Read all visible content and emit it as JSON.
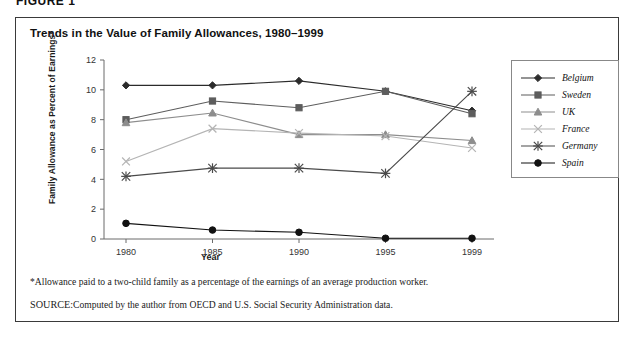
{
  "figure_label": "FIGURE 1",
  "panel": {
    "title": "Trends in the Value of Family Allowances, 1980–1999"
  },
  "footnotes": {
    "allowance_note": "*Allowance paid to a two-child family as a percentage of the earnings of an average production worker.",
    "source_prefix": "SOURCE:",
    "source_text": "Computed by the author from OECD and U.S. Social Security Administration data."
  },
  "legend": {
    "position": "right",
    "entries": [
      {
        "label": "Belgium",
        "marker": "diamond",
        "color": "#2b2b2b"
      },
      {
        "label": "Sweden",
        "marker": "square",
        "color": "#5d5d5d"
      },
      {
        "label": "UK",
        "marker": "triangle",
        "color": "#8d8d8d"
      },
      {
        "label": "France",
        "marker": "x",
        "color": "#b4b4b4"
      },
      {
        "label": "Germany",
        "marker": "asterisk",
        "color": "#4a4a4a"
      },
      {
        "label": "Spain",
        "marker": "circle",
        "color": "#111111"
      }
    ]
  },
  "chart_data": {
    "type": "line",
    "title": "Trends in the Value of Family Allowances, 1980–1999",
    "xlabel": "Year",
    "ylabel": "Family Allowance as Percent of Earnings*",
    "categories": [
      "1980",
      "1985",
      "1990",
      "1995",
      "1999"
    ],
    "x": [
      1980,
      1985,
      1990,
      1995,
      1999
    ],
    "ylim": [
      0,
      12
    ],
    "yticks": [
      0,
      2,
      4,
      6,
      8,
      10,
      12
    ],
    "grid": false,
    "legend_position": "right",
    "series": [
      {
        "name": "Belgium",
        "marker": "diamond",
        "color": "#2b2b2b",
        "values": [
          10.3,
          10.3,
          10.6,
          9.9,
          8.6
        ]
      },
      {
        "name": "Sweden",
        "marker": "square",
        "color": "#5d5d5d",
        "values": [
          8.0,
          9.25,
          8.8,
          9.9,
          8.4
        ]
      },
      {
        "name": "UK",
        "marker": "triangle",
        "color": "#8d8d8d",
        "values": [
          7.8,
          8.45,
          7.0,
          7.0,
          6.6
        ]
      },
      {
        "name": "France",
        "marker": "x",
        "color": "#b4b4b4",
        "values": [
          5.2,
          7.4,
          7.1,
          6.9,
          6.1
        ]
      },
      {
        "name": "Germany",
        "marker": "asterisk",
        "color": "#4a4a4a",
        "values": [
          4.2,
          4.75,
          4.75,
          4.4,
          9.9
        ]
      },
      {
        "name": "Spain",
        "marker": "circle",
        "color": "#111111",
        "values": [
          1.05,
          0.6,
          0.45,
          0.05,
          0.05
        ]
      }
    ]
  }
}
